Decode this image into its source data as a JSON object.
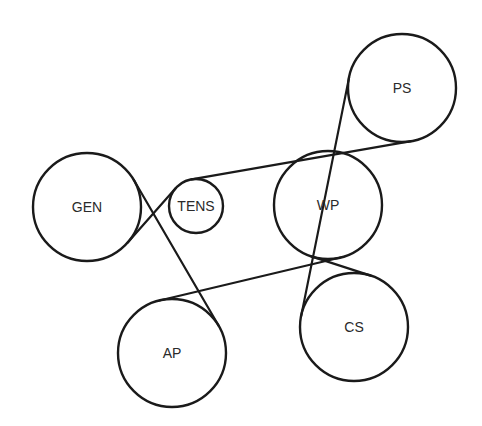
{
  "diagram": {
    "type": "serpentine-belt-routing",
    "pulleys": [
      {
        "id": "gen",
        "label": "GEN",
        "x": 87,
        "y": 207,
        "r": 54,
        "wrap": "outside"
      },
      {
        "id": "tens",
        "label": "TENS",
        "x": 196,
        "y": 206,
        "r": 27,
        "wrap": "inside"
      },
      {
        "id": "ps",
        "label": "PS",
        "x": 402,
        "y": 88,
        "r": 54,
        "wrap": "outside"
      },
      {
        "id": "cs",
        "label": "CS",
        "x": 354,
        "y": 327,
        "r": 54,
        "wrap": "outside"
      },
      {
        "id": "wp",
        "label": "WP",
        "x": 328,
        "y": 205,
        "r": 54,
        "wrap": "inside"
      },
      {
        "id": "ap",
        "label": "AP",
        "x": 172,
        "y": 353,
        "r": 54,
        "wrap": "outside"
      }
    ],
    "belt_order": [
      "gen",
      "tens",
      "ps",
      "cs",
      "wp",
      "ap"
    ],
    "colors": {
      "line": "#1a1a1a",
      "text": "#2a2a2a",
      "background": "#ffffff"
    }
  }
}
